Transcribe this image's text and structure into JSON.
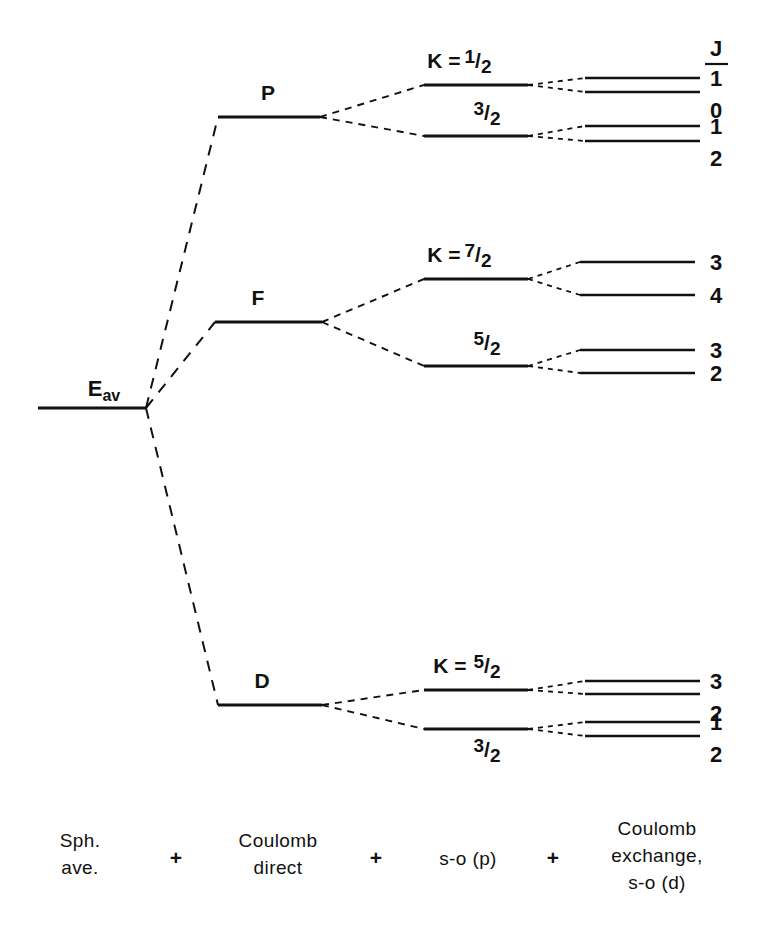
{
  "figure": {
    "type": "energy-level-splitting-diagram",
    "background_color": "#ffffff",
    "ink_color": "#111111"
  },
  "baseline": {
    "name": "E_av",
    "symbol": "E",
    "subscript": "av",
    "x1": 38,
    "x2": 146,
    "y": 408
  },
  "j_column": {
    "header": "J",
    "x": 716,
    "header_y": 56,
    "rule_y": 64,
    "rule_x1": 705,
    "rule_x2": 728
  },
  "terms": [
    {
      "label": "P",
      "label_x": 268,
      "label_y": 100,
      "line_x1": 218,
      "line_x2": 320,
      "line_y": 117,
      "k_levels": [
        {
          "prefix": "K  =",
          "value": "1/2",
          "numerator": "1",
          "denominator": "2",
          "label_x": 478,
          "label_y": 68,
          "show_prefix": true,
          "prefix_x": 444,
          "line_x1": 424,
          "line_x2": 528,
          "line_y": 85,
          "j_states": [
            {
              "J": "1",
              "line_x1": 585,
              "line_x2": 700,
              "line_y": 78,
              "label_x": 716,
              "label_y": 86
            },
            {
              "J": "0",
              "line_x1": 585,
              "line_x2": 700,
              "line_y": 92,
              "label_x": 716,
              "label_y": 118
            }
          ]
        },
        {
          "prefix": "",
          "value": "3/2",
          "numerator": "3",
          "denominator": "2",
          "label_x": 487,
          "label_y": 120,
          "show_prefix": false,
          "prefix_x": 0,
          "line_x1": 424,
          "line_x2": 528,
          "line_y": 136,
          "j_states": [
            {
              "J": "1",
              "line_x1": 585,
              "line_x2": 700,
              "line_y": 126,
              "label_x": 716,
              "label_y": 134
            },
            {
              "J": "2",
              "line_x1": 585,
              "line_x2": 700,
              "line_y": 141,
              "label_x": 716,
              "label_y": 166
            }
          ]
        }
      ]
    },
    {
      "label": "F",
      "label_x": 258,
      "label_y": 305,
      "line_x1": 215,
      "line_x2": 322,
      "line_y": 322,
      "k_levels": [
        {
          "prefix": "K  =",
          "value": "7/2",
          "numerator": "7",
          "denominator": "2",
          "label_x": 478,
          "label_y": 262,
          "show_prefix": true,
          "prefix_x": 444,
          "line_x1": 424,
          "line_x2": 528,
          "line_y": 279,
          "j_states": [
            {
              "J": "3",
              "line_x1": 580,
              "line_x2": 695,
              "line_y": 262,
              "label_x": 716,
              "label_y": 270
            },
            {
              "J": "4",
              "line_x1": 580,
              "line_x2": 695,
              "line_y": 295,
              "label_x": 716,
              "label_y": 303
            }
          ]
        },
        {
          "prefix": "",
          "value": "5/2",
          "numerator": "5",
          "denominator": "2",
          "label_x": 487,
          "label_y": 350,
          "show_prefix": false,
          "prefix_x": 0,
          "line_x1": 424,
          "line_x2": 528,
          "line_y": 366,
          "j_states": [
            {
              "J": "3",
              "line_x1": 580,
              "line_x2": 695,
              "line_y": 350,
              "label_x": 716,
              "label_y": 358
            },
            {
              "J": "2",
              "line_x1": 580,
              "line_x2": 695,
              "line_y": 373,
              "label_x": 716,
              "label_y": 381
            }
          ]
        }
      ]
    },
    {
      "label": "D",
      "label_x": 262,
      "label_y": 688,
      "line_x1": 218,
      "line_x2": 322,
      "line_y": 705,
      "k_levels": [
        {
          "prefix": "K  =",
          "value": "5/2",
          "numerator": "5",
          "denominator": "2",
          "label_x": 487,
          "label_y": 673,
          "show_prefix": true,
          "prefix_x": 450,
          "line_x1": 424,
          "line_x2": 528,
          "line_y": 690,
          "j_states": [
            {
              "J": "3",
              "line_x1": 585,
              "line_x2": 700,
              "line_y": 681,
              "label_x": 716,
              "label_y": 689
            },
            {
              "J": "2",
              "line_x1": 585,
              "line_x2": 700,
              "line_y": 694,
              "label_x": 716,
              "label_y": 721
            }
          ]
        },
        {
          "prefix": "",
          "value": "3/2",
          "numerator": "3",
          "denominator": "2",
          "label_x": 487,
          "label_y": 757,
          "show_prefix": false,
          "prefix_x": 0,
          "line_x1": 424,
          "line_x2": 528,
          "line_y": 729,
          "j_states": [
            {
              "J": "1",
              "line_x1": 585,
              "line_x2": 700,
              "line_y": 722,
              "label_x": 716,
              "label_y": 730
            },
            {
              "J": "2",
              "line_x1": 585,
              "line_x2": 700,
              "line_y": 736,
              "label_x": 716,
              "label_y": 762
            }
          ]
        }
      ]
    }
  ],
  "caption": {
    "baseline_y": 865,
    "columns": [
      {
        "lines": [
          "Sph.",
          "ave."
        ],
        "x": 80
      },
      {
        "lines": [
          "Coulomb",
          "direct"
        ],
        "x": 278
      },
      {
        "lines": [
          "s-o (p)",
          ""
        ],
        "x": 468
      },
      {
        "lines": [
          "Coulomb",
          "exchange,",
          "s-o (d)"
        ],
        "x": 657
      }
    ],
    "plus_signs": [
      {
        "symbol": "+",
        "x": 176,
        "y": 865
      },
      {
        "symbol": "+",
        "x": 376,
        "y": 865
      },
      {
        "symbol": "+",
        "x": 553,
        "y": 865
      }
    ]
  },
  "chart_data": {
    "type": "diagram",
    "stages": [
      "Sph. ave.",
      "Coulomb direct",
      "s-o (p)",
      "Coulomb exchange, s-o (d)"
    ],
    "terms": [
      "P",
      "F",
      "D"
    ],
    "k_values": {
      "P": [
        "1/2",
        "3/2"
      ],
      "F": [
        "7/2",
        "5/2"
      ],
      "D": [
        "5/2",
        "3/2"
      ]
    },
    "j_values": {
      "P": {
        "1/2": [
          "1",
          "0"
        ],
        "3/2": [
          "1",
          "2"
        ]
      },
      "F": {
        "7/2": [
          "3",
          "4"
        ],
        "5/2": [
          "3",
          "2"
        ]
      },
      "D": {
        "5/2": [
          "3",
          "2"
        ],
        "3/2": [
          "1",
          "2"
        ]
      }
    }
  }
}
